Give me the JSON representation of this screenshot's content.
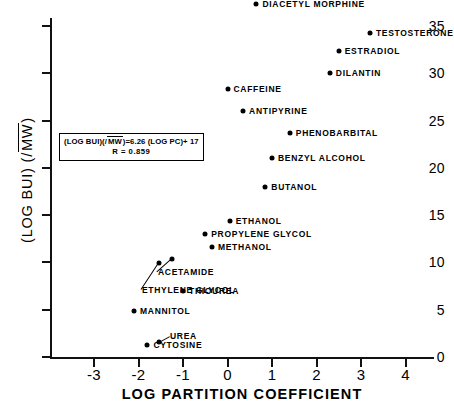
{
  "chart_data": {
    "type": "scatter",
    "title": "",
    "xlabel": "LOG PARTITION COEFFICIENT",
    "ylabel": "(LOG BUI) (/√MW)",
    "xlim": [
      -3.45,
      4.6
    ],
    "ylim": [
      0,
      38.8
    ],
    "xticks": [
      -3,
      -2,
      -1,
      0,
      1,
      2,
      3,
      4
    ],
    "xticklabels": [
      "-3",
      "-2",
      "-1",
      "0",
      "1",
      "2",
      "3",
      "4"
    ],
    "yticks": [
      0,
      5,
      10,
      15,
      20,
      25,
      30,
      35
    ],
    "yticklabels": [
      "0",
      "5",
      "10",
      "15",
      "20",
      "25",
      "30",
      "35"
    ],
    "grid": false,
    "legend": null,
    "annotation": {
      "equation": "(LOG BUI)(/√MW) = 6.26 (LOG PC) + 17",
      "equation_prefix": "(LOG BUI)(/",
      "equation_radical": "MW",
      "equation_suffix": ") = 6.26 (LOG PC) + 17",
      "correlation": "R = 0.859"
    },
    "points": [
      {
        "name": "DIACETYL MORPHINE",
        "x": 0.65,
        "y": 37.3,
        "side": "right"
      },
      {
        "name": "TESTOSTERONE",
        "x": 3.2,
        "y": 34.3,
        "side": "right"
      },
      {
        "name": "ESTRADIOL",
        "x": 2.5,
        "y": 32.4,
        "side": "right"
      },
      {
        "name": "DILANTIN",
        "x": 2.3,
        "y": 30.0,
        "side": "right"
      },
      {
        "name": "CAFFEINE",
        "x": 0.0,
        "y": 28.3,
        "side": "right"
      },
      {
        "name": "ANTIPYRINE",
        "x": 0.35,
        "y": 26.0,
        "side": "right"
      },
      {
        "name": "PHENOBARBITAL",
        "x": 1.4,
        "y": 23.7,
        "side": "right"
      },
      {
        "name": "BENZYL ALCOHOL",
        "x": 1.0,
        "y": 21.0,
        "side": "right"
      },
      {
        "name": "BUTANOL",
        "x": 0.85,
        "y": 18.0,
        "side": "right"
      },
      {
        "name": "ETHANOL",
        "x": 0.05,
        "y": 14.4,
        "side": "right"
      },
      {
        "name": "PROPYLENE GLYCOL",
        "x": -0.5,
        "y": 13.0,
        "side": "right"
      },
      {
        "name": "METHANOL",
        "x": -0.35,
        "y": 11.6,
        "side": "right"
      },
      {
        "name": "ACETAMIDE",
        "x": -1.25,
        "y": 10.4,
        "side": "leader"
      },
      {
        "name": "ETHYLENE GLYCOL",
        "x": -1.55,
        "y": 9.9,
        "side": "leader"
      },
      {
        "name": "THIOUREA",
        "x": -1.0,
        "y": 7.0,
        "side": "right"
      },
      {
        "name": "MANNITOL",
        "x": -2.1,
        "y": 4.9,
        "side": "right"
      },
      {
        "name": "UREA",
        "x": -1.55,
        "y": 1.6,
        "side": "leader"
      },
      {
        "name": "CYTOSINE",
        "x": -1.8,
        "y": 1.3,
        "side": "right"
      }
    ]
  }
}
